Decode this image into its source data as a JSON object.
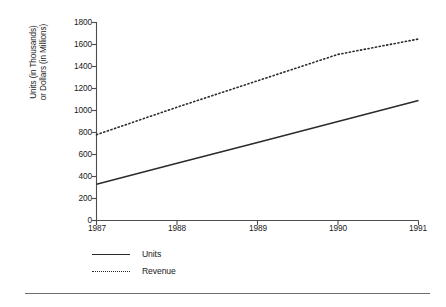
{
  "chart_data": {
    "type": "line",
    "title": "",
    "subtitle": "",
    "xlabel": "",
    "ylabel": "Units (in Thousands) or Dollars (in Millions)",
    "ylabel_lines": [
      "Units (in Thousands)",
      "or Dollars (in Millions)"
    ],
    "categories": [
      "1987",
      "1988",
      "1989",
      "1990",
      "1991"
    ],
    "x": [
      1987,
      1988,
      1989,
      1990,
      1991
    ],
    "xlim": [
      1987,
      1991
    ],
    "ylim": [
      0,
      1800
    ],
    "yticks": [
      1800,
      1600,
      1400,
      1200,
      1000,
      800,
      600,
      400,
      200,
      0
    ],
    "ytick_labels": [
      "1800",
      "1600",
      "1400",
      "1200",
      "1000",
      "800",
      "600",
      "400",
      "200",
      "0"
    ],
    "xticks": [
      1987,
      1988,
      1989,
      1990,
      1991
    ],
    "xtick_labels": [
      "1987",
      "1988",
      "1989",
      "1990",
      "1991"
    ],
    "grid": false,
    "legend_position": "below-left",
    "series": [
      {
        "name": "Units",
        "style": "solid",
        "color": "#2b2b2b",
        "values": [
          330,
          520,
          710,
          900,
          1090
        ]
      },
      {
        "name": "Revenue",
        "style": "dotted",
        "color": "#2b2b2b",
        "values": [
          780,
          1030,
          1270,
          1510,
          1650
        ]
      }
    ],
    "legend": [
      {
        "label": "Units",
        "style": "solid"
      },
      {
        "label": "Revenue",
        "style": "dotted"
      }
    ],
    "colors": {
      "axis": "#4d4d4d",
      "series": "#2b2b2b",
      "text": "#1a1a1a",
      "rule": "#6e6e6e",
      "background": "#ffffff"
    }
  }
}
